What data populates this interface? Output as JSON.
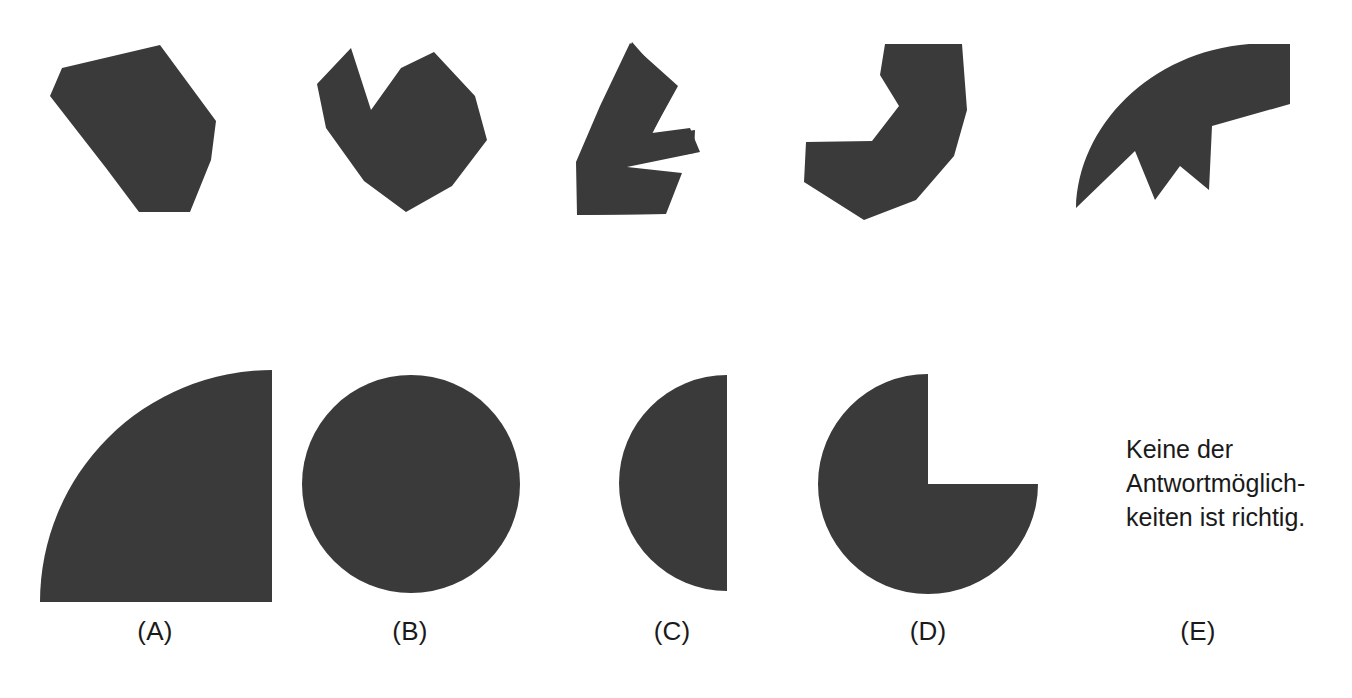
{
  "page": {
    "width": 1352,
    "height": 698,
    "background_color": "#ffffff",
    "shape_fill_color": "#3a3a3a",
    "text_color": "#1a1a1a"
  },
  "puzzle_pieces": {
    "description": "Five dark fragment shapes shown in the top row",
    "count": 5,
    "items": [
      {
        "index": 1,
        "name": "piece-1-hexagon-wedge"
      },
      {
        "index": 2,
        "name": "piece-2-notched-v"
      },
      {
        "index": 3,
        "name": "piece-3-zigzag-arrow"
      },
      {
        "index": 4,
        "name": "piece-4-hooked-band"
      },
      {
        "index": 5,
        "name": "piece-5-curved-crescent"
      }
    ]
  },
  "options": {
    "count": 5,
    "items": [
      {
        "key": "A",
        "label": "(A)",
        "shape": "quarter-circle"
      },
      {
        "key": "B",
        "label": "(B)",
        "shape": "full-circle"
      },
      {
        "key": "C",
        "label": "(C)",
        "shape": "half-circle"
      },
      {
        "key": "D",
        "label": "(D)",
        "shape": "three-quarter-circle"
      },
      {
        "key": "E",
        "label": "(E)",
        "shape": "text-none-of-the-above"
      }
    ]
  },
  "option_e_text": {
    "line1": "Keine der",
    "line2": "Antwortmöglich-",
    "line3": "keiten ist richtig."
  }
}
